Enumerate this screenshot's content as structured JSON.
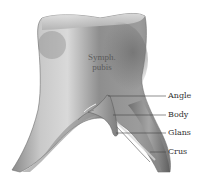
{
  "figure": {
    "region_label": {
      "line1": "Symph.",
      "line2": "pubis"
    },
    "labels": [
      {
        "id": "angle",
        "text": "Angle",
        "y": 96,
        "line_from_x": 108,
        "line_to_x": 166
      },
      {
        "id": "body",
        "text": "Body",
        "y": 115,
        "line_from_x": 113,
        "line_to_x": 166
      },
      {
        "id": "glans",
        "text": "Glans",
        "y": 133,
        "line_from_x": 116,
        "line_to_x": 166
      },
      {
        "id": "crus",
        "text": "Crus",
        "y": 152,
        "line_from_x": 150,
        "line_to_x": 166
      }
    ],
    "colors": {
      "background": "#ffffff",
      "bone_light": "#d6d6d6",
      "bone_mid": "#9a9a9a",
      "bone_dark": "#5e5e5e",
      "label_text": "#333333",
      "leader_line": "#444444"
    }
  }
}
